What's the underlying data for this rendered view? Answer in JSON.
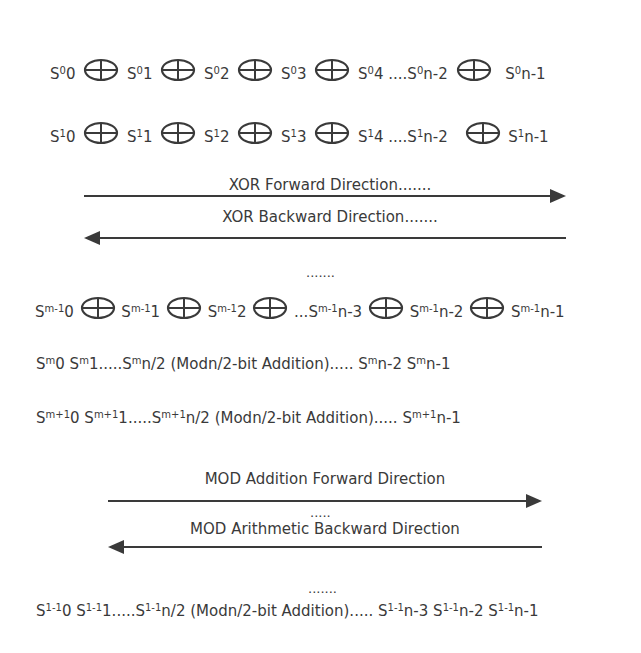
{
  "xor_rows": [
    {
      "terms": [
        {
          "base": "S",
          "sup": "0",
          "sub": "0"
        },
        {
          "base": "S",
          "sup": "0",
          "sub": "1"
        },
        {
          "base": "S",
          "sup": "0",
          "sub": "2"
        },
        {
          "base": "S",
          "sup": "0",
          "sub": "3"
        },
        {
          "base": "S",
          "sup": "0",
          "sub": "4 ....",
          "tail_base": "S",
          "tail_sup": "0",
          "tail_sub": "n-2"
        },
        {
          "base": "S",
          "sup": "0",
          "sub": "n-1"
        }
      ]
    },
    {
      "terms": [
        {
          "base": "S",
          "sup": "1",
          "sub": "0"
        },
        {
          "base": "S",
          "sup": "1",
          "sub": "1"
        },
        {
          "base": "S",
          "sup": "1",
          "sub": "2"
        },
        {
          "base": "S",
          "sup": "1",
          "sub": "3"
        },
        {
          "base": "S",
          "sup": "1",
          "sub": "4 ....",
          "tail_base": "S",
          "tail_sup": "1",
          "tail_sub": "n-2"
        },
        {
          "base": "S",
          "sup": "1",
          "sub": "n-1"
        }
      ]
    }
  ],
  "xor_arrows": {
    "forward_label": "XOR Forward Direction.......",
    "backward_label": "XOR Backward Direction.......",
    "ellipsis": "......."
  },
  "xor_last_row": {
    "terms": [
      {
        "base": "S",
        "sup": "m-1",
        "sub": "0"
      },
      {
        "base": "S",
        "sup": "m-1",
        "sub": "1"
      },
      {
        "base": "S",
        "sup": "m-1",
        "sub": "2"
      },
      {
        "prefix": "...",
        "base": "S",
        "sup": "m-1",
        "sub": "n-3"
      },
      {
        "base": "S",
        "sup": "m-1",
        "sub": "n-2"
      },
      {
        "base": "S",
        "sup": "m-1",
        "sub": "n-1"
      }
    ]
  },
  "mod_rows": [
    {
      "s0": {
        "sup": "m",
        "sub": "0"
      },
      "s1": {
        "sup": "m",
        "sub": "1....."
      },
      "s_half": {
        "sup": "m",
        "sub": "n/2"
      },
      "middle": " (Modn/2-bit Addition)..... ",
      "tail": [
        {
          "sup": "m",
          "sub": "n-2"
        },
        {
          "sup": "m",
          "sub": "n-1"
        }
      ]
    },
    {
      "s0": {
        "sup": "m+1",
        "sub": "0"
      },
      "s1": {
        "sup": "m+1",
        "sub": "1....."
      },
      "s_half": {
        "sup": "m+1",
        "sub": "n/2"
      },
      "middle": " (Modn/2-bit Addition)..... ",
      "tail": [
        {
          "sup": "m+1",
          "sub": "n-1"
        }
      ]
    }
  ],
  "mod_arrows": {
    "forward_label": "MOD Addition Forward Direction",
    "ellipsis_between": ".....",
    "backward_label": "MOD Arithmetic Backward Direction",
    "ellipsis_after": "......."
  },
  "mod_last_row": {
    "s0": {
      "sup": "1-1",
      "sub": "0"
    },
    "s1": {
      "sup": "1-1",
      "sub": "1....."
    },
    "s_half": {
      "sup": "1-1",
      "sub": "n/2"
    },
    "middle": " (Modn/2-bit Addition)..... ",
    "tail": [
      {
        "sup": "1-1",
        "sub": "n-3"
      },
      {
        "sup": "1-1",
        "sub": "n-2"
      },
      {
        "sup": "1-1",
        "sub": "n-1"
      }
    ]
  },
  "colors": {
    "text": "#3a3a3a",
    "line": "#3a3a3a"
  }
}
